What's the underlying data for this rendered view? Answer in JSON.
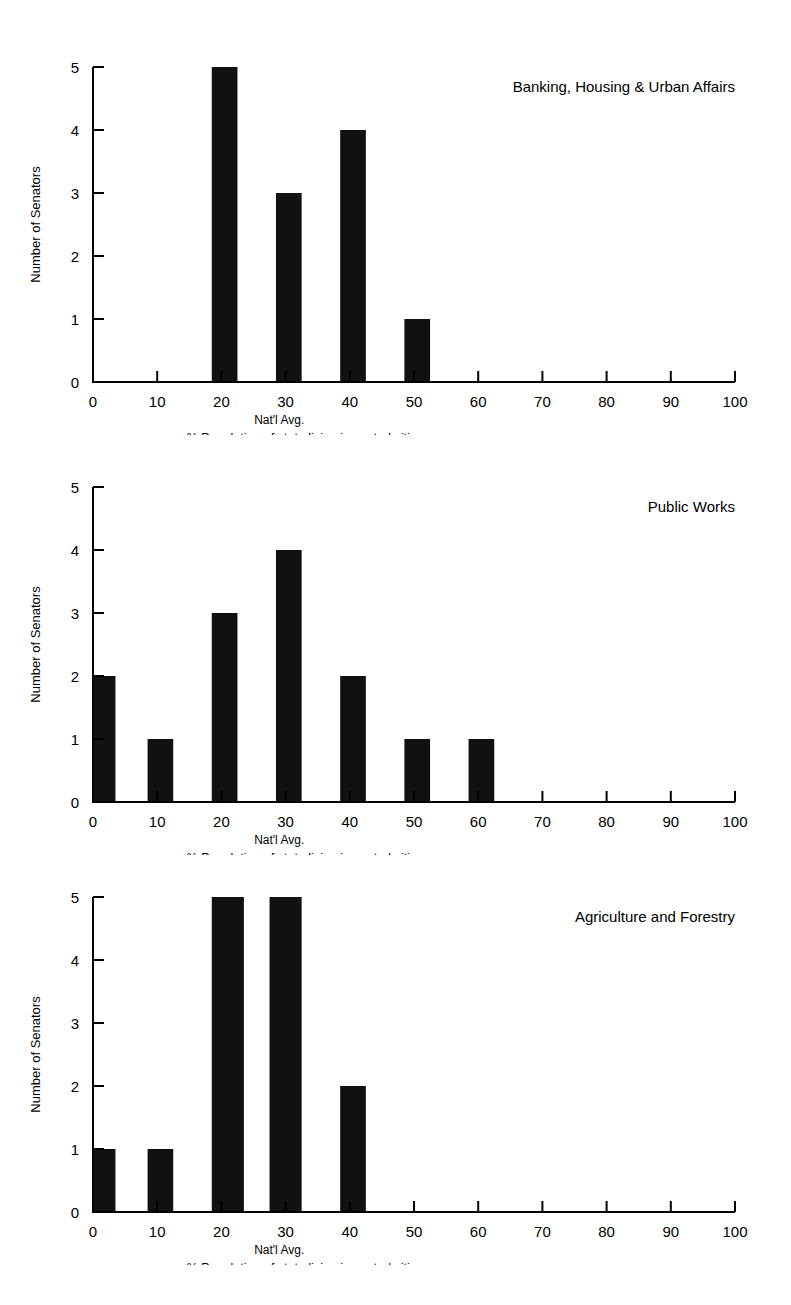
{
  "page": {
    "background": "#ffffff",
    "ink": "#000000",
    "bar_color": "#111111"
  },
  "shared": {
    "ylabel": "Number of Senators",
    "xlabel": "% Population of state living in central cities",
    "natl_avg_label": "Nat'l Avg.",
    "natl_avg_value": 29,
    "xticks": [
      0,
      10,
      20,
      30,
      40,
      50,
      60,
      70,
      80,
      90,
      100
    ],
    "xtick_labels": [
      "0",
      "10",
      "20",
      "30",
      "40",
      "50",
      "60",
      "70",
      "80",
      "90",
      "100"
    ],
    "yticks": [
      0,
      1,
      2,
      3,
      4,
      5
    ],
    "ytick_labels": [
      "0",
      "1",
      "2",
      "3",
      "4",
      "5"
    ]
  },
  "chart_data": [
    {
      "type": "bar",
      "title": "Banking, Housing & Urban Affairs",
      "xlabel": "% Population of state living in central cities",
      "ylabel": "Number of Senators",
      "xlim": [
        0,
        100
      ],
      "ylim": [
        0,
        5
      ],
      "grid": false,
      "legend": "none",
      "bins": [
        {
          "start": 18.5,
          "end": 22.5,
          "value": 5
        },
        {
          "start": 28.5,
          "end": 32.5,
          "value": 3
        },
        {
          "start": 38.5,
          "end": 42.5,
          "value": 4
        },
        {
          "start": 48.5,
          "end": 52.5,
          "value": 1
        }
      ],
      "annotations": [
        {
          "text": "Nat'l Avg.",
          "x": 29,
          "y": 0
        }
      ]
    },
    {
      "type": "bar",
      "title": "Public Works",
      "xlabel": "% Population of state living in central cities",
      "ylabel": "Number of Senators",
      "xlim": [
        0,
        100
      ],
      "ylim": [
        0,
        5
      ],
      "grid": false,
      "legend": "none",
      "bins": [
        {
          "start": 0.0,
          "end": 3.5,
          "value": 2
        },
        {
          "start": 8.5,
          "end": 12.5,
          "value": 1
        },
        {
          "start": 18.5,
          "end": 22.5,
          "value": 3
        },
        {
          "start": 28.5,
          "end": 32.5,
          "value": 4
        },
        {
          "start": 38.5,
          "end": 42.5,
          "value": 2
        },
        {
          "start": 48.5,
          "end": 52.5,
          "value": 1
        },
        {
          "start": 58.5,
          "end": 62.5,
          "value": 1
        }
      ],
      "annotations": [
        {
          "text": "Nat'l Avg.",
          "x": 29,
          "y": 0
        }
      ]
    },
    {
      "type": "bar",
      "title": "Agriculture and Forestry",
      "xlabel": "% Population of state living in central cities",
      "ylabel": "Number of Senators",
      "xlim": [
        0,
        100
      ],
      "ylim": [
        0,
        5
      ],
      "grid": false,
      "legend": "none",
      "bins": [
        {
          "start": 0.0,
          "end": 3.5,
          "value": 1
        },
        {
          "start": 8.5,
          "end": 12.5,
          "value": 1
        },
        {
          "start": 18.5,
          "end": 23.5,
          "value": 5
        },
        {
          "start": 27.5,
          "end": 32.5,
          "value": 5
        },
        {
          "start": 38.5,
          "end": 42.5,
          "value": 2
        }
      ],
      "annotations": [
        {
          "text": "Nat'l Avg.",
          "x": 29,
          "y": 0
        }
      ]
    }
  ]
}
